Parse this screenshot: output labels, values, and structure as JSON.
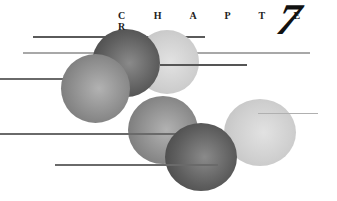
{
  "heading": {
    "label": "C H A P T E R",
    "number": "7"
  },
  "colors": {
    "background": "#ffffff",
    "line_dark": "#555555",
    "line_light": "#a8a8a8",
    "sphere_dark": "#5e5e5e",
    "sphere_mid": "#8c8c8c",
    "sphere_light": "#cfcfcf"
  }
}
